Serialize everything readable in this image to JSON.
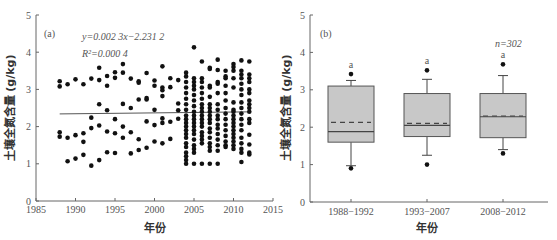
{
  "chart_data": [
    {
      "panel": "(a)",
      "type": "scatter",
      "xlabel": "年份",
      "ylabel": "土壤全氮含量 (g/kg)",
      "xlim": [
        1985,
        2015
      ],
      "ylim": [
        0,
        5
      ],
      "xticks": [
        1985,
        1990,
        1995,
        2000,
        2005,
        2010,
        2015
      ],
      "yticks": [
        0,
        1,
        2,
        3,
        4,
        5
      ],
      "annotations": [
        "y=0.002 3x−2.231 2",
        "R²=0.000 4"
      ],
      "trendline": {
        "slope": 0.0023,
        "intercept": -2.2312,
        "x_range": [
          1988,
          2012
        ]
      },
      "points": [
        [
          1988,
          3.22
        ],
        [
          1988,
          3.08
        ],
        [
          1988,
          1.85
        ],
        [
          1988,
          1.73
        ],
        [
          1989,
          3.14
        ],
        [
          1989,
          1.7
        ],
        [
          1989,
          1.07
        ],
        [
          1990,
          3.27
        ],
        [
          1990,
          1.77
        ],
        [
          1990,
          1.14
        ],
        [
          1991,
          3.14
        ],
        [
          1991,
          1.82
        ],
        [
          1991,
          1.59
        ],
        [
          1991,
          1.24
        ],
        [
          1992,
          3.29
        ],
        [
          1992,
          2.24
        ],
        [
          1992,
          1.96
        ],
        [
          1992,
          0.95
        ],
        [
          1993,
          3.58
        ],
        [
          1993,
          3.25
        ],
        [
          1993,
          2.6
        ],
        [
          1993,
          2.03
        ],
        [
          1993,
          1.1
        ],
        [
          1994,
          3.36
        ],
        [
          1994,
          3.1
        ],
        [
          1994,
          2.44
        ],
        [
          1994,
          1.87
        ],
        [
          1994,
          1.31
        ],
        [
          1995,
          3.46
        ],
        [
          1995,
          3.31
        ],
        [
          1995,
          2.2
        ],
        [
          1995,
          1.82
        ],
        [
          1995,
          1.29
        ],
        [
          1996,
          3.68
        ],
        [
          1996,
          3.45
        ],
        [
          1996,
          2.61
        ],
        [
          1996,
          2.0
        ],
        [
          1996,
          1.7
        ],
        [
          1997,
          3.29
        ],
        [
          1997,
          2.5
        ],
        [
          1997,
          1.85
        ],
        [
          1997,
          1.28
        ],
        [
          1998,
          3.22
        ],
        [
          1998,
          3.18
        ],
        [
          1998,
          2.73
        ],
        [
          1998,
          1.66
        ],
        [
          1998,
          1.37
        ],
        [
          1999,
          3.44
        ],
        [
          1999,
          2.77
        ],
        [
          1999,
          2.73
        ],
        [
          1999,
          2.14
        ],
        [
          1999,
          1.43
        ],
        [
          2000,
          3.24
        ],
        [
          2000,
          3.1
        ],
        [
          2000,
          2.45
        ],
        [
          2000,
          2.04
        ],
        [
          2000,
          1.6
        ],
        [
          2001,
          3.62
        ],
        [
          2001,
          3.05
        ],
        [
          2001,
          2.98
        ],
        [
          2001,
          2.82
        ],
        [
          2001,
          2.22
        ],
        [
          2001,
          2.1
        ],
        [
          2001,
          1.55
        ],
        [
          2002,
          3.3
        ],
        [
          2002,
          3.06
        ],
        [
          2002,
          2.13
        ],
        [
          2002,
          1.67
        ],
        [
          2003,
          3.25
        ],
        [
          2003,
          2.62
        ],
        [
          2003,
          2.44
        ],
        [
          2003,
          2.21
        ],
        [
          2004,
          3.45
        ],
        [
          2004,
          3.35
        ],
        [
          2004,
          3.2
        ],
        [
          2004,
          3.05
        ],
        [
          2004,
          2.9
        ],
        [
          2004,
          2.75
        ],
        [
          2004,
          2.6
        ],
        [
          2004,
          2.45
        ],
        [
          2004,
          2.3
        ],
        [
          2004,
          2.2
        ],
        [
          2004,
          2.1
        ],
        [
          2004,
          2.0
        ],
        [
          2004,
          1.9
        ],
        [
          2004,
          1.8
        ],
        [
          2004,
          1.7
        ],
        [
          2004,
          1.55
        ],
        [
          2004,
          1.45
        ],
        [
          2004,
          1.3
        ],
        [
          2004,
          1.2
        ],
        [
          2004,
          1.1
        ],
        [
          2004,
          1.0
        ],
        [
          2005,
          4.13
        ],
        [
          2005,
          3.3
        ],
        [
          2005,
          3.2
        ],
        [
          2005,
          3.1
        ],
        [
          2005,
          3.0
        ],
        [
          2005,
          2.85
        ],
        [
          2005,
          2.7
        ],
        [
          2005,
          2.55
        ],
        [
          2005,
          2.4
        ],
        [
          2005,
          2.3
        ],
        [
          2005,
          2.2
        ],
        [
          2005,
          2.1
        ],
        [
          2005,
          2.0
        ],
        [
          2005,
          1.9
        ],
        [
          2005,
          1.8
        ],
        [
          2005,
          1.65
        ],
        [
          2005,
          1.5
        ],
        [
          2005,
          1.4
        ],
        [
          2005,
          1.3
        ],
        [
          2005,
          1.0
        ],
        [
          2006,
          3.75
        ],
        [
          2006,
          3.3
        ],
        [
          2006,
          3.2
        ],
        [
          2006,
          3.05
        ],
        [
          2006,
          2.9
        ],
        [
          2006,
          2.75
        ],
        [
          2006,
          2.6
        ],
        [
          2006,
          2.5
        ],
        [
          2006,
          2.4
        ],
        [
          2006,
          2.3
        ],
        [
          2006,
          2.2
        ],
        [
          2006,
          2.1
        ],
        [
          2006,
          2.0
        ],
        [
          2006,
          1.85
        ],
        [
          2006,
          1.75
        ],
        [
          2006,
          1.65
        ],
        [
          2006,
          1.55
        ],
        [
          2006,
          1.0
        ],
        [
          2007,
          3.58
        ],
        [
          2007,
          3.55
        ],
        [
          2007,
          3.1
        ],
        [
          2007,
          3.05
        ],
        [
          2007,
          2.8
        ],
        [
          2007,
          2.6
        ],
        [
          2007,
          2.5
        ],
        [
          2007,
          2.4
        ],
        [
          2007,
          2.3
        ],
        [
          2007,
          2.2
        ],
        [
          2007,
          2.1
        ],
        [
          2007,
          1.95
        ],
        [
          2007,
          1.85
        ],
        [
          2007,
          1.7
        ],
        [
          2007,
          1.55
        ],
        [
          2007,
          1.45
        ],
        [
          2007,
          1.35
        ],
        [
          2007,
          1.0
        ],
        [
          2008,
          3.8
        ],
        [
          2008,
          3.52
        ],
        [
          2008,
          3.2
        ],
        [
          2008,
          3.15
        ],
        [
          2008,
          2.9
        ],
        [
          2008,
          2.6
        ],
        [
          2008,
          2.45
        ],
        [
          2008,
          2.3
        ],
        [
          2008,
          2.2
        ],
        [
          2008,
          2.05
        ],
        [
          2008,
          1.95
        ],
        [
          2008,
          1.8
        ],
        [
          2008,
          1.65
        ],
        [
          2008,
          1.5
        ],
        [
          2008,
          1.35
        ],
        [
          2008,
          1.0
        ],
        [
          2009,
          3.5
        ],
        [
          2009,
          3.35
        ],
        [
          2009,
          3.3
        ],
        [
          2009,
          3.1
        ],
        [
          2009,
          2.9
        ],
        [
          2009,
          2.7
        ],
        [
          2009,
          2.5
        ],
        [
          2009,
          2.35
        ],
        [
          2009,
          2.2
        ],
        [
          2009,
          2.05
        ],
        [
          2009,
          1.9
        ],
        [
          2009,
          1.75
        ],
        [
          2009,
          1.6
        ],
        [
          2009,
          1.5
        ],
        [
          2009,
          1.45
        ],
        [
          2010,
          3.68
        ],
        [
          2010,
          3.6
        ],
        [
          2010,
          3.5
        ],
        [
          2010,
          3.3
        ],
        [
          2010,
          3.05
        ],
        [
          2010,
          2.65
        ],
        [
          2010,
          2.45
        ],
        [
          2010,
          2.4
        ],
        [
          2010,
          2.3
        ],
        [
          2010,
          2.2
        ],
        [
          2010,
          2.1
        ],
        [
          2010,
          2.0
        ],
        [
          2010,
          1.9
        ],
        [
          2010,
          1.8
        ],
        [
          2010,
          1.7
        ],
        [
          2010,
          1.6
        ],
        [
          2010,
          1.5
        ],
        [
          2010,
          1.4
        ],
        [
          2011,
          3.78
        ],
        [
          2011,
          3.5
        ],
        [
          2011,
          3.4
        ],
        [
          2011,
          3.3
        ],
        [
          2011,
          3.15
        ],
        [
          2011,
          3.0
        ],
        [
          2011,
          2.85
        ],
        [
          2011,
          2.65
        ],
        [
          2011,
          2.5
        ],
        [
          2011,
          2.35
        ],
        [
          2011,
          2.2
        ],
        [
          2011,
          2.05
        ],
        [
          2011,
          1.9
        ],
        [
          2011,
          1.7
        ],
        [
          2011,
          1.55
        ],
        [
          2011,
          1.4
        ],
        [
          2011,
          1.3
        ],
        [
          2011,
          1.05
        ],
        [
          2012,
          3.75
        ],
        [
          2012,
          3.4
        ],
        [
          2012,
          3.3
        ],
        [
          2012,
          3.2
        ],
        [
          2012,
          3.0
        ],
        [
          2012,
          2.9
        ],
        [
          2012,
          2.7
        ],
        [
          2012,
          2.6
        ],
        [
          2012,
          2.5
        ],
        [
          2012,
          2.4
        ],
        [
          2012,
          2.2
        ],
        [
          2012,
          2.1
        ],
        [
          2012,
          1.78
        ],
        [
          2012,
          1.52
        ],
        [
          2012,
          1.3
        ],
        [
          2012,
          1.25
        ]
      ]
    },
    {
      "panel": "(b)",
      "type": "box",
      "xlabel": "年份",
      "ylabel": "土壤全氮含量 (g/kg)",
      "ylim": [
        0,
        5
      ],
      "yticks": [
        0,
        1,
        2,
        3,
        4,
        5
      ],
      "categories": [
        "1988−1992",
        "1993−2007",
        "2008−2012"
      ],
      "annotations": [
        "n=302"
      ],
      "significance_letters": [
        "a",
        "a",
        "a"
      ],
      "boxes": [
        {
          "q1": 1.6,
          "median": 1.88,
          "mean": 2.13,
          "q3": 3.1,
          "whisker_low": 0.97,
          "whisker_high": 3.25,
          "outliers": [
            3.42,
            0.9
          ]
        },
        {
          "q1": 1.75,
          "median": 2.05,
          "mean": 2.1,
          "q3": 2.9,
          "whisker_low": 1.25,
          "whisker_high": 3.28,
          "outliers": [
            3.52,
            1.0
          ]
        },
        {
          "q1": 1.72,
          "median": 2.28,
          "mean": 2.3,
          "q3": 2.9,
          "whisker_low": 1.4,
          "whisker_high": 3.38,
          "outliers": [
            3.68,
            1.3
          ]
        }
      ],
      "box_fill": "#c8c8c8"
    }
  ],
  "labels": {
    "panel_a": "(a)",
    "panel_b": "(b)",
    "equation": "y=0.002 3x−2.231 2",
    "r2": "R²=0.000 4",
    "n": "n=302",
    "xlabel": "年份",
    "ylabel": "土壤全氮含量 (g/kg)"
  }
}
